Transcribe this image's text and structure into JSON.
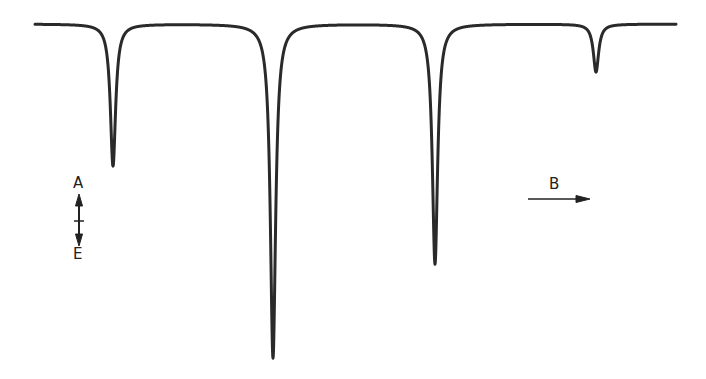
{
  "chart_data": {
    "type": "line",
    "title": "",
    "xlabel": "B",
    "ylabel": "A / E",
    "baseline_y_px": 24,
    "x_range_px": [
      35,
      676
    ],
    "grid": false,
    "legend": null,
    "peaks": [
      {
        "index": 1,
        "x_px": 113,
        "depth_px": 142,
        "min_y_px": 166,
        "relative_intensity": 0.43
      },
      {
        "index": 2,
        "x_px": 273,
        "depth_px": 334,
        "min_y_px": 358,
        "relative_intensity": 1.0
      },
      {
        "index": 3,
        "x_px": 435,
        "depth_px": 240,
        "min_y_px": 264,
        "relative_intensity": 0.72
      },
      {
        "index": 4,
        "x_px": 596,
        "depth_px": 48,
        "min_y_px": 72,
        "relative_intensity": 0.14
      }
    ],
    "annotations": [
      {
        "text": "A",
        "meaning": "absorption direction (up)"
      },
      {
        "text": "E",
        "meaning": "emission direction (down)"
      },
      {
        "text": "B",
        "meaning": "magnetic field axis, arrow pointing right"
      }
    ]
  },
  "labels": {
    "absorption": "A",
    "emission": "E",
    "field": "B"
  },
  "style": {
    "line_color": "#2a2a2a",
    "text_color": "#222222",
    "background": "#ffffff"
  }
}
